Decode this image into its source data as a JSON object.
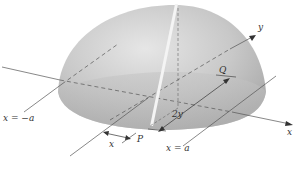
{
  "diagram": {
    "labels": {
      "y_axis": "y",
      "x_axis": "x",
      "point_q": "Q",
      "point_p": "P",
      "width_2y": "2y",
      "distance_x": "x",
      "left_bound": "x = −a",
      "right_bound": "x = a"
    },
    "colors": {
      "solid_light": "#d9d9d9",
      "solid_mid": "#bdbdbd",
      "solid_dark": "#a8a8a8",
      "slice": "#f2f2f2",
      "line": "#555555"
    }
  }
}
